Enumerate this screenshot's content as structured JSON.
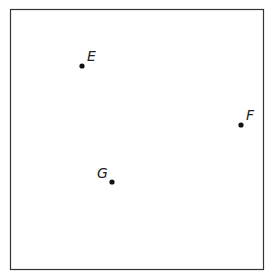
{
  "diagram": {
    "frame": {
      "x": 10,
      "y": 9,
      "width": 253,
      "height": 260,
      "stroke": "#333333"
    },
    "points": [
      {
        "label": "E",
        "x": 82,
        "y": 66,
        "lx": 87,
        "ly": 61
      },
      {
        "label": "F",
        "x": 241,
        "y": 125,
        "lx": 246,
        "ly": 120
      },
      {
        "label": "G",
        "x": 112,
        "y": 182,
        "lx": 97,
        "ly": 178
      }
    ]
  }
}
